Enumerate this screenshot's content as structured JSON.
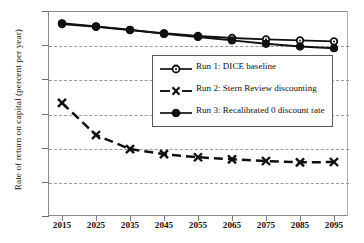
{
  "chart_data": {
    "type": "line",
    "title": "",
    "subtitle": "",
    "xlabel": "",
    "ylabel": "Rate of return on capital (percent per year)",
    "x": [
      2015,
      2025,
      2035,
      2045,
      2055,
      2065,
      2075,
      2085,
      2095
    ],
    "categories": [
      "2015",
      "2025",
      "2035",
      "2045",
      "2055",
      "2065",
      "2075",
      "2085",
      "2095"
    ],
    "xtick_labels": [
      "2015",
      "2025",
      "2035",
      "2045",
      "2055",
      "2065",
      "2075",
      "2085",
      "2095"
    ],
    "ytick_labels": [
      "0%",
      "1%",
      "2%",
      "3%",
      "4%",
      "5%",
      "6%"
    ],
    "ytick_values": [
      0,
      1,
      2,
      3,
      4,
      5,
      6
    ],
    "ylim": [
      0,
      6
    ],
    "xlim": [
      2010,
      2100
    ],
    "yunit": "%",
    "grid": "horizontal-dashed",
    "legend_position": "center",
    "series": [
      {
        "name": "Run 1: DICE baseline",
        "marker": "open-circle",
        "linestyle": "solid",
        "color": "#111111",
        "values": [
          5.62,
          5.54,
          5.44,
          5.35,
          5.27,
          5.21,
          5.17,
          5.14,
          5.11
        ]
      },
      {
        "name": "Run 2: Stern Review discounting",
        "marker": "x-cross",
        "linestyle": "dashed",
        "color": "#111111",
        "values": [
          3.31,
          2.37,
          1.96,
          1.81,
          1.72,
          1.66,
          1.61,
          1.57,
          1.58
        ]
      },
      {
        "name": "Run 3: Recalibrated 0 discount rate",
        "marker": "filled-circle",
        "linestyle": "solid",
        "color": "#111111",
        "values": [
          5.64,
          5.55,
          5.45,
          5.33,
          5.24,
          5.14,
          5.04,
          4.96,
          4.91
        ]
      }
    ]
  },
  "legend": {
    "entries": [
      {
        "label": "Run 1: DICE baseline",
        "marker": "open-circle"
      },
      {
        "label": "Run 2: Stern Review discounting",
        "marker": "x-cross"
      },
      {
        "label": "Run 3: Recalibrated 0 discount rate",
        "marker": "filled-circle"
      }
    ]
  }
}
